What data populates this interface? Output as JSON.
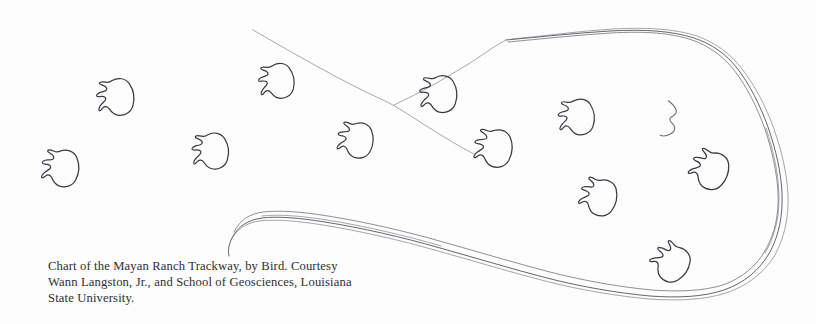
{
  "figure": {
    "title": "Chart of the Mayan Ranch Trackway",
    "medium": "hand-drawn ink chart",
    "background_color": "#fdfdfd",
    "ink_color": "#3a3a42",
    "contour_color": "#4a4a52",
    "survey_line_color": "#8b8b93"
  },
  "caption": {
    "line1": "Chart of the Mayan Ranch Trackway, by Bird. Courtesy",
    "line2": "Wann Langston, Jr., and School of Geosciences, Louisiana",
    "line3": "State University."
  },
  "diagram": {
    "track_count": 13,
    "tracks": [
      {
        "id": "track-01",
        "x": 117,
        "y": 97,
        "rotation": -8,
        "scale": 1.0,
        "style": "complete"
      },
      {
        "id": "track-02",
        "x": 62,
        "y": 168,
        "rotation": 4,
        "scale": 1.0,
        "style": "complete"
      },
      {
        "id": "track-03",
        "x": 212,
        "y": 151,
        "rotation": -6,
        "scale": 0.98,
        "style": "complete"
      },
      {
        "id": "track-04",
        "x": 278,
        "y": 81,
        "rotation": -10,
        "scale": 0.95,
        "style": "complete"
      },
      {
        "id": "track-05",
        "x": 357,
        "y": 140,
        "rotation": 6,
        "scale": 0.96,
        "style": "complete"
      },
      {
        "id": "track-06",
        "x": 440,
        "y": 94,
        "rotation": -4,
        "scale": 1.0,
        "style": "complete"
      },
      {
        "id": "track-07",
        "x": 495,
        "y": 148,
        "rotation": 5,
        "scale": 1.02,
        "style": "complete"
      },
      {
        "id": "track-08",
        "x": 578,
        "y": 117,
        "rotation": -6,
        "scale": 0.97,
        "style": "complete"
      },
      {
        "id": "track-09",
        "x": 674,
        "y": 120,
        "rotation": 10,
        "scale": 1.0,
        "style": "partial"
      },
      {
        "id": "track-10",
        "x": 711,
        "y": 170,
        "rotation": 22,
        "scale": 1.02,
        "style": "complete"
      },
      {
        "id": "track-11",
        "x": 600,
        "y": 197,
        "rotation": 14,
        "scale": 0.99,
        "style": "complete"
      },
      {
        "id": "track-12",
        "x": 672,
        "y": 263,
        "rotation": 35,
        "scale": 1.0,
        "style": "complete"
      }
    ],
    "survey_lines": [
      {
        "id": "survey-line-main",
        "description": "long diagonal from upper left to mid right"
      },
      {
        "id": "survey-line-branch",
        "description": "branch rising to contour junction"
      }
    ],
    "contour": {
      "id": "trackway-contour",
      "description": "doubled hand-drawn outline of the trackway surface lobe",
      "junction_point": {
        "x": 506,
        "y": 40
      }
    }
  }
}
